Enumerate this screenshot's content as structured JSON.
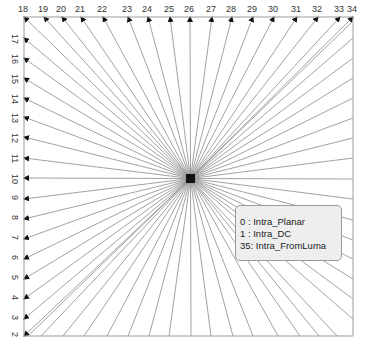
{
  "diagram": {
    "top_mode_labels": [
      "18",
      "19",
      "20",
      "21",
      "22",
      "23",
      "24",
      "25",
      "26",
      "27",
      "28",
      "29",
      "30",
      "31",
      "32",
      "33",
      "34"
    ],
    "left_mode_labels": [
      "17",
      "16",
      "15",
      "14",
      "13",
      "12",
      "11",
      "10",
      "9",
      "8",
      "7",
      "6",
      "5",
      "4",
      "3",
      "2"
    ],
    "center_mode_index": "26",
    "colors": {
      "line": "#8a8a8a",
      "border": "#9a9a9a",
      "arrow": "#111111",
      "legend_bg": "#eeeeee",
      "text": "#333333"
    }
  },
  "legend": {
    "items": [
      {
        "code": "0 ",
        "name": "Intra_Planar"
      },
      {
        "code": "1 ",
        "name": "Intra_DC"
      },
      {
        "code": "35",
        "name": "Intra_FromLuma"
      }
    ]
  }
}
